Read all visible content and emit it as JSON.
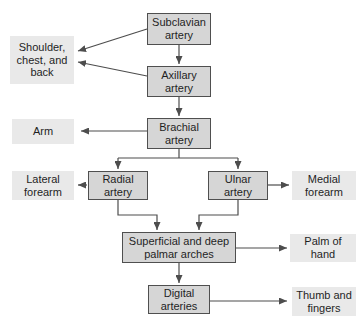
{
  "nodes": {
    "subclavian": {
      "label": "Subclavian artery"
    },
    "axillary": {
      "label": "Axillary artery"
    },
    "brachial": {
      "label": "Brachial artery"
    },
    "radial": {
      "label": "Radial artery"
    },
    "ulnar": {
      "label": "Ulnar artery"
    },
    "palmar_arches": {
      "label": "Superficial and deep palmar arches"
    },
    "digital": {
      "label": "Digital arteries"
    }
  },
  "regions": {
    "shoulder_chest_back": {
      "label": "Shoulder, chest, and back"
    },
    "arm": {
      "label": "Arm"
    },
    "lateral_forearm": {
      "label": "Lateral forearm"
    },
    "medial_forearm": {
      "label": "Medial forearm"
    },
    "palm_of_hand": {
      "label": "Palm of hand"
    },
    "thumb_and_fingers": {
      "label": "Thumb and fingers"
    }
  },
  "edges": [
    {
      "from": "subclavian",
      "to": "shoulder_chest_back"
    },
    {
      "from": "axillary",
      "to": "shoulder_chest_back"
    },
    {
      "from": "subclavian",
      "to": "axillary"
    },
    {
      "from": "axillary",
      "to": "brachial"
    },
    {
      "from": "brachial",
      "to": "arm"
    },
    {
      "from": "brachial",
      "to": "radial"
    },
    {
      "from": "brachial",
      "to": "ulnar"
    },
    {
      "from": "radial",
      "to": "lateral_forearm"
    },
    {
      "from": "ulnar",
      "to": "medial_forearm"
    },
    {
      "from": "radial",
      "to": "palmar_arches"
    },
    {
      "from": "ulnar",
      "to": "palmar_arches"
    },
    {
      "from": "palmar_arches",
      "to": "palm_of_hand"
    },
    {
      "from": "palmar_arches",
      "to": "digital"
    },
    {
      "from": "digital",
      "to": "thumb_and_fingers"
    }
  ],
  "colors": {
    "background": "#ffffff",
    "artery_box_fill": "#d6d6d6",
    "artery_box_border": "#4f4f4f",
    "region_box_fill": "#e9e9e9",
    "arrow": "#4d4d4d",
    "text": "#1f1f1f"
  }
}
